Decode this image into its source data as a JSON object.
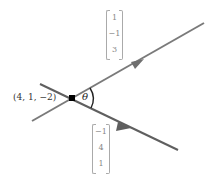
{
  "diagram": {
    "point_label": "(4, 1, −2)",
    "angle_label": "θ",
    "direction_vector_1": {
      "entries": [
        "1",
        "−1",
        "3"
      ]
    },
    "direction_vector_2": {
      "entries": [
        "−1",
        "4",
        "1"
      ]
    },
    "colors": {
      "line": "#7a7a7a",
      "point": "#000000",
      "vector_text": "#888888",
      "arc": "#222222"
    }
  }
}
